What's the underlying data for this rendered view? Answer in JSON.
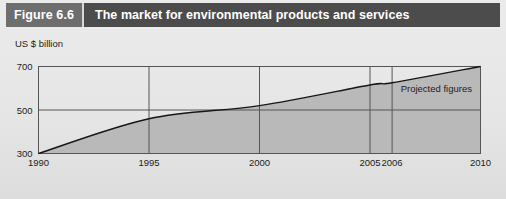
{
  "figure": {
    "number_label": "Figure 6.6",
    "title": "The market for environmental products and services"
  },
  "colors": {
    "header_bar": "#4c4c4c",
    "figure_number_box": "#6e6e6e",
    "header_text": "#ffffff",
    "page_background": "#e7e7e7",
    "plot_background": "#ffffff",
    "area_fill": "#b8b8b8",
    "line": "#1a1a1a",
    "grid": "#555555"
  },
  "chart_data": {
    "type": "area",
    "title": "The market for environmental products and services",
    "xlabel": "",
    "ylabel": "US $ billion",
    "x": [
      1990,
      1995,
      2000,
      2005,
      2006,
      2010
    ],
    "values": [
      300,
      460,
      520,
      615,
      625,
      700
    ],
    "series": [
      {
        "name": "Market value",
        "values": [
          300,
          460,
          520,
          615,
          625,
          700
        ]
      }
    ],
    "xlim": [
      1990,
      2010
    ],
    "ylim": [
      300,
      700
    ],
    "xticks": [
      1990,
      1995,
      2000,
      2005,
      2006,
      2010
    ],
    "xtick_labels": [
      "1990",
      "1995",
      "2000",
      "2005",
      "2006",
      "2010"
    ],
    "yticks": [
      300,
      500,
      700
    ],
    "ytick_labels": [
      "300",
      "500",
      "700"
    ],
    "grid": true,
    "legend": "none",
    "annotations": [
      {
        "text": "Projected figures",
        "x_start": 2006,
        "x_end": 2010
      }
    ]
  },
  "axis": {
    "y_title": "US $ billion"
  }
}
